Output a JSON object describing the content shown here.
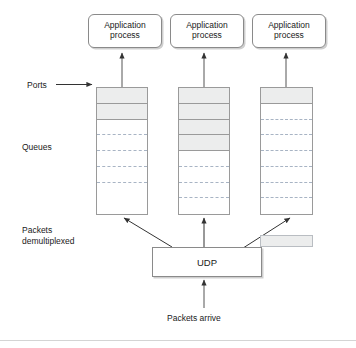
{
  "figure": {
    "type": "network-protocol-diagram"
  },
  "colors": {
    "stroke": "#8a8a8a",
    "queue_stroke": "#9a9a9a",
    "filled_segment": "#eceded",
    "dashed_divider": "#a8b4c4",
    "text": "#1a1a1a",
    "shadow": "#cfcfcf",
    "background": "#ffffff"
  },
  "app_processes": [
    {
      "line1": "Application",
      "line2": "process"
    },
    {
      "line1": "Application",
      "line2": "process"
    },
    {
      "line1": "Application",
      "line2": "process"
    }
  ],
  "labels": {
    "ports": "Ports",
    "queues": "Queues",
    "packets_demultiplexed_line1": "Packets",
    "packets_demultiplexed_line2": "demultiplexed",
    "packets_arrive": "Packets arrive"
  },
  "udp": {
    "label": "UDP"
  },
  "loose_packet": {
    "state": "filled"
  },
  "queues": [
    {
      "name": "queue-1",
      "filled_count": 2,
      "total_slots": 8,
      "segments": [
        "filled",
        "filled",
        "empty-dashed",
        "empty-dashed",
        "empty-dashed",
        "empty-dashed",
        "empty-plain",
        "empty-plain"
      ]
    },
    {
      "name": "queue-2",
      "filled_count": 4,
      "total_slots": 8,
      "segments": [
        "filled",
        "filled",
        "filled",
        "filled",
        "empty-dashed",
        "empty-dashed",
        "empty-dashed",
        "empty-plain"
      ]
    },
    {
      "name": "queue-3",
      "filled_count": 1,
      "total_slots": 8,
      "segments": [
        "filled",
        "empty-dashed",
        "empty-dashed",
        "empty-dashed",
        "empty-dashed",
        "empty-dashed",
        "empty-dashed",
        "empty-plain"
      ]
    }
  ],
  "geometry": {
    "app_box_tops": 14,
    "app_box_lefts": [
      88,
      170,
      252
    ],
    "queue_lefts": [
      96,
      178,
      260
    ],
    "queue_top": 87,
    "queue_width": 52,
    "queue_height": 128
  },
  "arrows": {
    "ports_pointer": "Ports label arrow pointing right to first queue top",
    "queue_to_app": "vertical arrows from each queue top to its application process",
    "udp_to_queues": "three arrows fanning out from UDP box up to queue bottoms",
    "arrive_to_udp": "vertical arrow from Packets arrive up into UDP box"
  }
}
